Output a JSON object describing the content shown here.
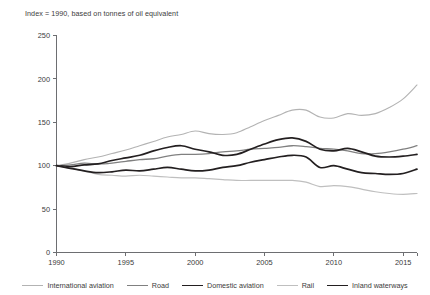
{
  "chart_data": {
    "type": "line",
    "title": "",
    "subtitle": "Index = 1990, based on tonnes of oil equivalent",
    "xlabel": "",
    "ylabel": "",
    "xlim": [
      1990,
      2016
    ],
    "ylim": [
      0,
      250
    ],
    "yticks": [
      0,
      50,
      100,
      150,
      200,
      250
    ],
    "xticks": [
      1990,
      1995,
      2000,
      2005,
      2010,
      2015
    ],
    "xtick_labels": [
      "1990",
      "1995",
      "2000",
      "2005",
      "2010",
      "2015"
    ],
    "ytick_labels": [
      "0",
      "50",
      "100",
      "150",
      "200",
      "250"
    ],
    "grid": false,
    "legend_position": "bottom",
    "x": [
      1990,
      1991,
      1992,
      1993,
      1994,
      1995,
      1996,
      1997,
      1998,
      1999,
      2000,
      2001,
      2002,
      2003,
      2004,
      2005,
      2006,
      2007,
      2008,
      2009,
      2010,
      2011,
      2012,
      2013,
      2014,
      2015,
      2016
    ],
    "series": [
      {
        "name": "International aviation",
        "color": "#b3b3b3",
        "width": 1.1,
        "values": [
          100,
          103,
          107,
          110,
          114,
          118,
          123,
          128,
          133,
          136,
          140,
          137,
          136,
          138,
          145,
          152,
          158,
          164,
          164,
          156,
          155,
          160,
          158,
          160,
          167,
          177,
          193
        ]
      },
      {
        "name": "Road",
        "color": "#808080",
        "width": 1.3,
        "values": [
          100,
          101,
          103,
          102,
          103,
          105,
          107,
          108,
          111,
          113,
          113,
          114,
          116,
          117,
          119,
          120,
          121,
          123,
          122,
          120,
          119,
          117,
          114,
          114,
          116,
          119,
          123
        ]
      },
      {
        "name": "Domestic aviation",
        "color": "#231f20",
        "width": 1.7,
        "values": [
          100,
          99,
          101,
          102,
          106,
          109,
          112,
          117,
          121,
          123,
          119,
          116,
          112,
          113,
          119,
          125,
          130,
          132,
          128,
          119,
          117,
          120,
          116,
          111,
          110,
          111,
          113
        ]
      },
      {
        "name": "Rail",
        "color": "#bfbfbf",
        "width": 1.2,
        "values": [
          100,
          97,
          94,
          90,
          89,
          88,
          89,
          88,
          87,
          86,
          86,
          85,
          84,
          83,
          83,
          83,
          83,
          83,
          81,
          76,
          77,
          76,
          73,
          70,
          68,
          67,
          68
        ]
      },
      {
        "name": "Inland waterways",
        "color": "#231f20",
        "width": 1.7,
        "values": [
          100,
          97,
          94,
          92,
          93,
          95,
          94,
          96,
          98,
          96,
          94,
          95,
          98,
          100,
          104,
          107,
          110,
          112,
          110,
          98,
          100,
          96,
          92,
          91,
          90,
          91,
          96
        ]
      }
    ]
  },
  "legend": {
    "items": [
      {
        "label": "International aviation",
        "color": "#b3b3b3",
        "width": 1.1
      },
      {
        "label": "Road",
        "color": "#808080",
        "width": 1.3
      },
      {
        "label": "Domestic aviation",
        "color": "#231f20",
        "width": 1.9
      },
      {
        "label": "Rail",
        "color": "#bfbfbf",
        "width": 1.2
      },
      {
        "label": "Inland waterways",
        "color": "#231f20",
        "width": 1.9
      }
    ]
  }
}
